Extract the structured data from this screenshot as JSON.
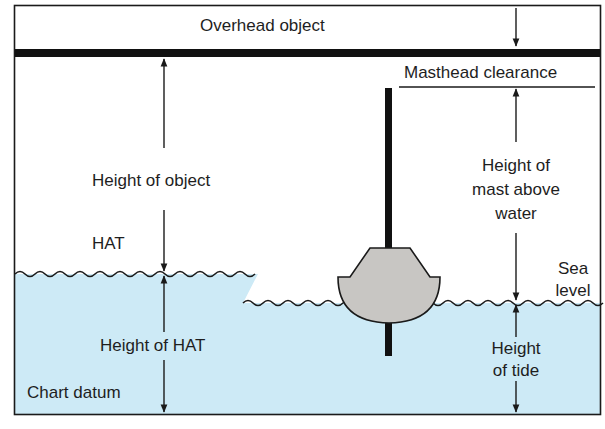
{
  "diagram": {
    "title_label": "Overhead object",
    "labels": {
      "overhead_object": "Overhead object",
      "masthead_clearance": "Masthead clearance",
      "height_of_object": "Height of object",
      "hat": "HAT",
      "height_of_hat": "Height of HAT",
      "chart_datum": "Chart datum",
      "height_of_mast_line1": "Height of",
      "height_of_mast_line2": "mast above",
      "height_of_mast_line3": "water",
      "sea_level_line1": "Sea",
      "sea_level_line2": "level",
      "height_of_tide_line1": "Height",
      "height_of_tide_line2": "of tide"
    },
    "colors": {
      "water": "#cdeaf6",
      "boat_hull": "#c8c6c3",
      "line": "#1a1a1a",
      "background": "#ffffff"
    }
  }
}
